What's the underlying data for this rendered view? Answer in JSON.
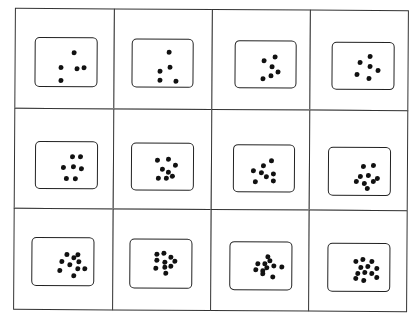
{
  "grid": {
    "rows": 3,
    "cols": 4,
    "line_color": "#333333",
    "dot_color": "#111111"
  },
  "cards": [
    {
      "row": 0,
      "col": 0,
      "count": 5,
      "dots": [
        [
          52,
          22
        ],
        [
          34,
          50
        ],
        [
          56,
          52
        ],
        [
          66,
          49
        ],
        [
          34,
          72
        ]
      ]
    },
    {
      "row": 0,
      "col": 1,
      "count": 5,
      "dots": [
        [
          50,
          20
        ],
        [
          37,
          54
        ],
        [
          51,
          47
        ],
        [
          37,
          70
        ],
        [
          60,
          72
        ]
      ]
    },
    {
      "row": 0,
      "col": 2,
      "count": 6,
      "dots": [
        [
          54,
          26
        ],
        [
          38,
          33
        ],
        [
          50,
          44
        ],
        [
          59,
          53
        ],
        [
          48,
          61
        ],
        [
          37,
          67
        ]
      ]
    },
    {
      "row": 0,
      "col": 3,
      "count": 6,
      "dots": [
        [
          50,
          21
        ],
        [
          36,
          33
        ],
        [
          51,
          41
        ],
        [
          62,
          48
        ],
        [
          32,
          55
        ],
        [
          49,
          63
        ]
      ]
    },
    {
      "row": 1,
      "col": 0,
      "count": 7,
      "dots": [
        [
          49,
          24
        ],
        [
          61,
          24
        ],
        [
          36,
          44
        ],
        [
          50,
          42
        ],
        [
          62,
          46
        ],
        [
          41,
          64
        ],
        [
          54,
          64
        ]
      ]
    },
    {
      "row": 1,
      "col": 1,
      "count": 8,
      "dots": [
        [
          34,
          28
        ],
        [
          49,
          26
        ],
        [
          59,
          36
        ],
        [
          40,
          44
        ],
        [
          49,
          50
        ],
        [
          35,
          61
        ],
        [
          46,
          60
        ],
        [
          55,
          57
        ]
      ]
    },
    {
      "row": 1,
      "col": 2,
      "count": 8,
      "dots": [
        [
          52,
          26
        ],
        [
          40,
          34
        ],
        [
          26,
          44
        ],
        [
          37,
          48
        ],
        [
          54,
          50
        ],
        [
          44,
          56
        ],
        [
          55,
          62
        ],
        [
          28,
          64
        ]
      ]
    },
    {
      "row": 1,
      "col": 3,
      "count": 9,
      "dots": [
        [
          46,
          30
        ],
        [
          61,
          29
        ],
        [
          42,
          48
        ],
        [
          54,
          46
        ],
        [
          66,
          52
        ],
        [
          36,
          58
        ],
        [
          48,
          62
        ],
        [
          61,
          58
        ],
        [
          52,
          70
        ]
      ]
    },
    {
      "row": 2,
      "col": 0,
      "count": 10,
      "dots": [
        [
          47,
          26
        ],
        [
          56,
          32
        ],
        [
          62,
          27
        ],
        [
          39,
          40
        ],
        [
          50,
          45
        ],
        [
          63,
          40
        ],
        [
          36,
          56
        ],
        [
          62,
          53
        ],
        [
          72,
          53
        ],
        [
          57,
          66
        ]
      ]
    },
    {
      "row": 2,
      "col": 1,
      "count": 10,
      "dots": [
        [
          35,
          23
        ],
        [
          45,
          20
        ],
        [
          55,
          28
        ],
        [
          35,
          33
        ],
        [
          47,
          37
        ],
        [
          61,
          35
        ],
        [
          34,
          47
        ],
        [
          46,
          45
        ],
        [
          55,
          44
        ],
        [
          48,
          56
        ]
      ]
    },
    {
      "row": 2,
      "col": 2,
      "count": 11,
      "dots": [
        [
          50,
          23
        ],
        [
          37,
          36
        ],
        [
          46,
          36
        ],
        [
          54,
          31
        ],
        [
          59,
          39
        ],
        [
          71,
          42
        ],
        [
          33,
          46
        ],
        [
          43,
          48
        ],
        [
          49,
          43
        ],
        [
          44,
          55
        ],
        [
          58,
          60
        ]
      ]
    },
    {
      "row": 2,
      "col": 3,
      "count": 12,
      "dots": [
        [
          37,
          29
        ],
        [
          47,
          24
        ],
        [
          59,
          29
        ],
        [
          43,
          40
        ],
        [
          53,
          37
        ],
        [
          67,
          41
        ],
        [
          39,
          51
        ],
        [
          49,
          49
        ],
        [
          59,
          51
        ],
        [
          37,
          60
        ],
        [
          48,
          63
        ],
        [
          67,
          58
        ]
      ]
    }
  ]
}
